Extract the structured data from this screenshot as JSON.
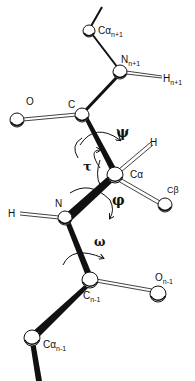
{
  "diagram": {
    "atoms": {
      "ca_next": {
        "label": "Cα",
        "sub": "n+1"
      },
      "n_next": {
        "label": "N",
        "sub": "n+1"
      },
      "h_next": {
        "label": "H",
        "sub": "n+1"
      },
      "c": {
        "label": "C",
        "sub": ""
      },
      "o": {
        "label": "O",
        "sub": ""
      },
      "ca": {
        "label": "Cα",
        "sub": ""
      },
      "h_ca": {
        "label": "H",
        "sub": ""
      },
      "cb": {
        "label": "Cβ",
        "sub": ""
      },
      "n": {
        "label": "N",
        "sub": ""
      },
      "h_n": {
        "label": "H",
        "sub": ""
      },
      "c_prev": {
        "label": "C",
        "sub": "n-1"
      },
      "o_prev": {
        "label": "O",
        "sub": "n-1"
      },
      "ca_prev": {
        "label": "Cα",
        "sub": "n-1"
      }
    },
    "angles": {
      "psi": "ψ",
      "tau": "τ",
      "phi": "φ",
      "omega": "ω"
    },
    "colors": {
      "ink": "#111111",
      "atom_fill": "#ffffff"
    }
  }
}
